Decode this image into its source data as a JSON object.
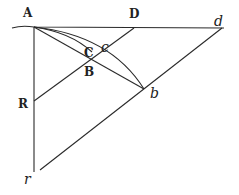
{
  "diagram": {
    "stroke": "#2a2a2a",
    "points": {
      "A": {
        "label": "A",
        "x": 34,
        "y": 27,
        "lx": 23,
        "ly": 17
      },
      "D": {
        "label": "D",
        "x": 134,
        "y": 28,
        "lx": 129,
        "ly": 18
      },
      "d": {
        "label": "d",
        "x": 222,
        "y": 28,
        "lx": 214,
        "ly": 26
      },
      "C": {
        "label": "C",
        "lx": 84,
        "ly": 57
      },
      "c": {
        "label": "c",
        "lx": 101,
        "ly": 52
      },
      "B": {
        "label": "B",
        "x": 92,
        "y": 65,
        "lx": 84,
        "ly": 76
      },
      "b": {
        "label": "b",
        "x": 144,
        "y": 89,
        "lx": 150,
        "ly": 98
      },
      "R": {
        "label": "R",
        "x": 34,
        "y": 101,
        "lx": 18,
        "ly": 108
      },
      "r": {
        "label": "r",
        "x": 34,
        "y": 172,
        "lx": 24,
        "ly": 184
      }
    }
  }
}
